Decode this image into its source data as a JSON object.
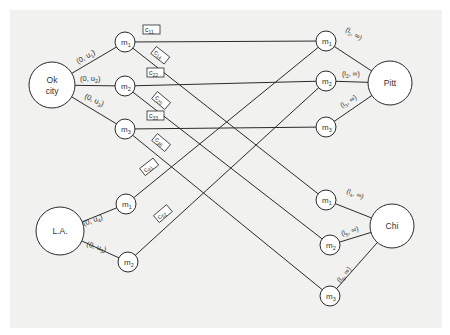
{
  "diagram": {
    "background": "#f1f1f0",
    "line_color": "#2a2a2a",
    "sources": [
      {
        "id": "okc",
        "label_line1": "Ok",
        "label_line2": "city",
        "x": 52,
        "y": 85,
        "r": 23
      },
      {
        "id": "la",
        "label_line1": "L.A.",
        "label_line2": "",
        "x": 60,
        "y": 231,
        "r": 24
      }
    ],
    "sinks": [
      {
        "id": "pitt",
        "label": "Pitt",
        "x": 390,
        "y": 83,
        "r": 22
      },
      {
        "id": "chi",
        "label": "Chi",
        "x": 392,
        "y": 226,
        "r": 22
      }
    ],
    "left_nodes": [
      {
        "id": "L1",
        "label": "m1",
        "x": 125,
        "y": 42
      },
      {
        "id": "L2",
        "label": "m2",
        "x": 125,
        "y": 86
      },
      {
        "id": "L3",
        "label": "m3",
        "x": 125,
        "y": 129
      },
      {
        "id": "L4",
        "label": "m1",
        "x": 126,
        "y": 204
      },
      {
        "id": "L5",
        "label": "m2",
        "x": 128,
        "y": 262
      }
    ],
    "right_nodes": [
      {
        "id": "R1",
        "label": "m1",
        "x": 326,
        "y": 41
      },
      {
        "id": "R2",
        "label": "m2",
        "x": 326,
        "y": 81
      },
      {
        "id": "R3",
        "label": "m3",
        "x": 326,
        "y": 127
      },
      {
        "id": "R4",
        "label": "m1",
        "x": 326,
        "y": 200
      },
      {
        "id": "R5",
        "label": "m2",
        "x": 330,
        "y": 245
      },
      {
        "id": "R6",
        "label": "m3",
        "x": 330,
        "y": 296
      }
    ],
    "source_edges": [
      {
        "label": "(0, u1)",
        "base": "(0, u",
        "sub": "1",
        "close": ")"
      },
      {
        "label": "(0, u2)",
        "base": "(0, u",
        "sub": "2",
        "close": ")"
      },
      {
        "label": "(0, u3)",
        "base": "(0, u",
        "sub": "3",
        "close": ")"
      },
      {
        "label": "(0, u4)",
        "base": "(0, u",
        "sub": "4",
        "close": ")"
      },
      {
        "label": "(0, u5)",
        "base": "(0, u",
        "sub": "5",
        "close": ")"
      }
    ],
    "sink_edges": [
      {
        "label": "(l1, ∞)",
        "base": "(l",
        "sub": "1",
        "close": ", ∞)"
      },
      {
        "label": "(l2, ∞)",
        "base": "(l",
        "sub": "2",
        "close": ", ∞)"
      },
      {
        "label": "(l3, ∞)",
        "base": "(l",
        "sub": "3",
        "close": ", ∞)"
      },
      {
        "label": "(l4, ∞)",
        "base": "(l",
        "sub": "4",
        "close": ", ∞)"
      },
      {
        "label": "(l5, ∞)",
        "base": "(l",
        "sub": "5",
        "close": ", ∞)"
      },
      {
        "label": "(l6, ∞)",
        "base": "(l",
        "sub": "6",
        "close": ", ∞)"
      }
    ],
    "cost_edges": [
      {
        "label": "c11",
        "sub": "11",
        "from": "L1",
        "to": "R1"
      },
      {
        "label": "c14",
        "sub": "14",
        "from": "L1",
        "to": "R4"
      },
      {
        "label": "c22",
        "sub": "22",
        "from": "L2",
        "to": "R2"
      },
      {
        "label": "c25",
        "sub": "25",
        "from": "L2",
        "to": "R5"
      },
      {
        "label": "c33",
        "sub": "33",
        "from": "L3",
        "to": "R3"
      },
      {
        "label": "c36",
        "sub": "36",
        "from": "L3",
        "to": "R6"
      },
      {
        "label": "c41",
        "sub": "41",
        "from": "L4",
        "to": "R1"
      },
      {
        "label": "c52",
        "sub": "52",
        "from": "L5",
        "to": "R2"
      }
    ]
  }
}
